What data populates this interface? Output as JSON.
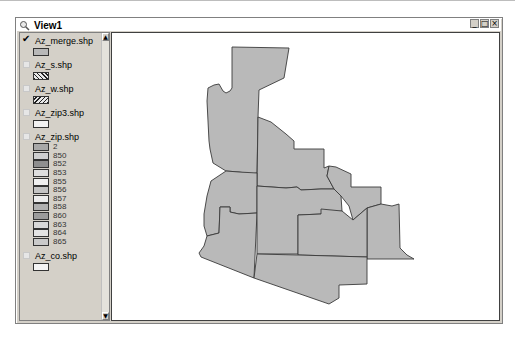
{
  "window": {
    "title": "View1",
    "controls": {
      "minimize": "_",
      "maximize": "□",
      "close": "×"
    }
  },
  "legend": {
    "themes": [
      {
        "name": "Az_merge.shp",
        "checked": true,
        "symbol": "solid",
        "color": "#b8b8b8"
      },
      {
        "name": "Az_s.shp",
        "checked": false,
        "symbol": "hatch-right",
        "color": "#e8e8e8"
      },
      {
        "name": "Az_w.shp",
        "checked": false,
        "symbol": "hatch-left",
        "color": "#e8e8e8"
      },
      {
        "name": "Az_zip3.shp",
        "checked": false,
        "symbol": "solid",
        "color": "#f2f2f2"
      },
      {
        "name": "Az_zip.shp",
        "checked": false,
        "symbol": "classes",
        "classes": [
          {
            "label": "2",
            "color": "#a8a8a8"
          },
          {
            "label": "850",
            "color": "#cfcfcf"
          },
          {
            "label": "852",
            "color": "#8f8f8f"
          },
          {
            "label": "853",
            "color": "#dedede"
          },
          {
            "label": "855",
            "color": "#f0f0f0"
          },
          {
            "label": "856",
            "color": "#c4c4c4"
          },
          {
            "label": "857",
            "color": "#ececec"
          },
          {
            "label": "858",
            "color": "#b0b0b0"
          },
          {
            "label": "860",
            "color": "#9c9c9c"
          },
          {
            "label": "863",
            "color": "#d8d8d8"
          },
          {
            "label": "864",
            "color": "#e4e4e4"
          },
          {
            "label": "865",
            "color": "#cacaca"
          }
        ]
      },
      {
        "name": "Az_co.shp",
        "checked": false,
        "symbol": "solid",
        "color": "#f4f4f4"
      }
    ]
  },
  "map": {
    "fill": "#b9b9b9",
    "stroke": "#3a3a3a",
    "region": "Arizona counties (merged view)"
  }
}
